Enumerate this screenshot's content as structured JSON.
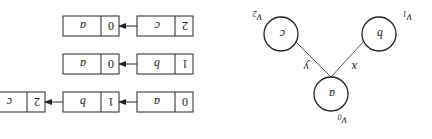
{
  "orientation": "rotated-180",
  "graph": {
    "vertices": [
      {
        "id": "v0",
        "label": "a",
        "name": "v",
        "subscript": "0"
      },
      {
        "id": "v1",
        "label": "b",
        "name": "v",
        "subscript": "1"
      },
      {
        "id": "v2",
        "label": "c",
        "name": "v",
        "subscript": "2"
      }
    ],
    "edges": [
      {
        "from": "v0",
        "to": "v1",
        "label": "x"
      },
      {
        "from": "v0",
        "to": "v2",
        "label": "y"
      }
    ]
  },
  "adjacency_list": [
    {
      "index": "0",
      "vertex": "a",
      "nodes": [
        {
          "index": "1",
          "vertex": "b"
        },
        {
          "index": "2",
          "vertex": "c"
        }
      ]
    },
    {
      "index": "1",
      "vertex": "b",
      "nodes": [
        {
          "index": "0",
          "vertex": "a"
        }
      ]
    },
    {
      "index": "2",
      "vertex": "c",
      "nodes": [
        {
          "index": "0",
          "vertex": "a"
        }
      ]
    }
  ]
}
